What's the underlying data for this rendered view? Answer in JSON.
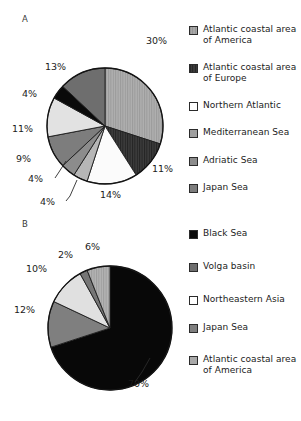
{
  "figure": {
    "panel_a_label": "A",
    "panel_b_label": "B"
  },
  "chart_data": [
    {
      "type": "pie",
      "id": "chart-a",
      "title": "A",
      "labels": [
        "Atlantic coastal area of America",
        "Atlantic coastal area of Europe",
        "Northern Atlantic",
        "Mediterranean Sea",
        "Adriatic Sea",
        "Japan Sea",
        "Black Sea",
        "Volga basin"
      ],
      "values": [
        30,
        11,
        14,
        4,
        4,
        9,
        11,
        4
      ],
      "value_labels": [
        "30%",
        "11%",
        "14%",
        "4%",
        "4%",
        "9%",
        "11%",
        "4%"
      ],
      "extra_slice_label": "13%",
      "slices": [
        {
          "label": "30%",
          "value": 30,
          "color": "#a8a8a8",
          "pattern": "vertical-lines",
          "lx": 146,
          "ly": 44
        },
        {
          "label": "11%",
          "value": 11,
          "color": "#3a3a3a",
          "pattern": "vertical-lines",
          "lx": 152,
          "ly": 172
        },
        {
          "label": "14%",
          "value": 14,
          "color": "#fbfbfb",
          "pattern": "solid",
          "lx": 100,
          "ly": 198
        },
        {
          "label": "4%",
          "value": 4,
          "color": "#b6b6b6",
          "pattern": "solid",
          "lx": 40,
          "ly": 205,
          "leader": true
        },
        {
          "label": "4%",
          "value": 4,
          "color": "#8c8c8c",
          "pattern": "solid",
          "lx": 28,
          "ly": 182,
          "leader": true
        },
        {
          "label": "9%",
          "value": 9,
          "color": "#7d7d7d",
          "pattern": "solid",
          "lx": 16,
          "ly": 162
        },
        {
          "label": "11%",
          "value": 11,
          "color": "#e2e2e2",
          "pattern": "solid",
          "lx": 12,
          "ly": 132
        },
        {
          "label": "4%",
          "value": 4,
          "color": "#0a0a0a",
          "pattern": "solid",
          "lx": 22,
          "ly": 97
        },
        {
          "label": "13%",
          "value": 13,
          "color": "#6e6e6e",
          "pattern": "solid",
          "lx": 45,
          "ly": 70
        }
      ],
      "legend_title": "",
      "legend_position": "right"
    },
    {
      "type": "pie",
      "id": "chart-b",
      "title": "B",
      "labels": [
        "Black Sea",
        "Volga basin",
        "Northeastern Asia",
        "Japan Sea",
        "Atlantic coastal area of America"
      ],
      "values": [
        70,
        12,
        10,
        2,
        6
      ],
      "value_labels": [
        "70%",
        "12%",
        "10%",
        "2%",
        "6%"
      ],
      "slices": [
        {
          "label": "70%",
          "value": 70,
          "color": "#080808",
          "pattern": "solid",
          "lx": 128,
          "ly": 387,
          "leader": true
        },
        {
          "label": "12%",
          "value": 12,
          "color": "#7f7f7f",
          "pattern": "solid",
          "lx": 14,
          "ly": 313
        },
        {
          "label": "10%",
          "value": 10,
          "color": "#e0e0e0",
          "pattern": "solid",
          "lx": 26,
          "ly": 272
        },
        {
          "label": "2%",
          "value": 2,
          "color": "#767676",
          "pattern": "solid",
          "lx": 58,
          "ly": 258
        },
        {
          "label": "6%",
          "value": 6,
          "color": "#a9a9a9",
          "pattern": "vertical-lines",
          "lx": 85,
          "ly": 250
        }
      ],
      "legend_position": "right"
    }
  ],
  "legend_a": {
    "items": [
      {
        "label": "Atlantic coastal area of America",
        "color": "#a8a8a8",
        "pattern": "vertical-lines",
        "top": 0
      },
      {
        "label": "Atlantic coastal area of Europe",
        "color": "#3a3a3a",
        "pattern": "vertical-lines",
        "top": 38
      },
      {
        "label": "Northern Atlantic",
        "color": "#ffffff",
        "pattern": "solid",
        "top": 76
      },
      {
        "label": "Mediterranean Sea",
        "color": "#a0a0a0",
        "pattern": "solid",
        "top": 103
      },
      {
        "label": "Adriatic Sea",
        "color": "#8c8c8c",
        "pattern": "solid",
        "top": 131
      },
      {
        "label": "Japan Sea",
        "color": "#7d7d7d",
        "pattern": "solid",
        "top": 158
      }
    ]
  },
  "legend_b": {
    "items": [
      {
        "label": "Black Sea",
        "color": "#0a0a0a",
        "pattern": "solid",
        "top": 0
      },
      {
        "label": "Volga basin",
        "color": "#6e6e6e",
        "pattern": "solid",
        "top": 33
      },
      {
        "label": "Northeastern Asia",
        "color": "#ffffff",
        "pattern": "solid",
        "top": 66
      },
      {
        "label": "Japan Sea",
        "color": "#7f7f7f",
        "pattern": "solid",
        "top": 94
      },
      {
        "label": "Atlantic coastal area of America",
        "color": "#a9a9a9",
        "pattern": "solid",
        "top": 126
      }
    ]
  }
}
